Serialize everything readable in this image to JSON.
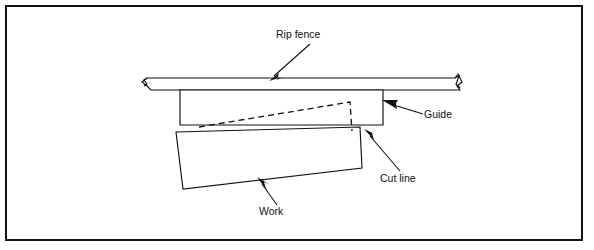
{
  "figure": {
    "type": "line-diagram",
    "background_color": "#ffffff",
    "ink_color": "#111111",
    "frame": {
      "name": "outer-border",
      "x": 6,
      "y": 6,
      "width": 576,
      "height": 234,
      "stroke_width": 2
    },
    "labels": [
      {
        "id": "rip-fence",
        "text": "Rip fence",
        "x": 276,
        "y": 38,
        "anchor": "start",
        "leader": {
          "x1": 310,
          "y1": 44,
          "x2": 271,
          "y2": 79
        }
      },
      {
        "id": "guide",
        "text": "Guide",
        "x": 424,
        "y": 118,
        "anchor": "start",
        "leader": {
          "x1": 420,
          "y1": 114,
          "x2": 382,
          "y2": 104
        }
      },
      {
        "id": "cut-line",
        "text": "Cut line",
        "x": 380,
        "y": 182,
        "anchor": "start",
        "leader": {
          "x1": 399,
          "y1": 172,
          "x2": 364,
          "y2": 131
        }
      },
      {
        "id": "work",
        "text": "Work",
        "x": 259,
        "y": 215,
        "anchor": "start",
        "leader": {
          "x1": 276,
          "y1": 204,
          "x2": 257,
          "y2": 180
        }
      }
    ],
    "parts": {
      "rip_fence": {
        "name": "Rip fence",
        "description": "Long horizontal bar with break symbols at both ends",
        "top_y": 78,
        "bottom_y": 89,
        "left_x": 140,
        "right_x": 460
      },
      "guide": {
        "name": "Guide",
        "description": "Rectangular block below the fence",
        "left_x": 180,
        "right_x": 383,
        "top_y": 89,
        "bottom_y": 125
      },
      "work": {
        "name": "Work",
        "description": "Tilted rectangular workpiece",
        "corners": [
          [
            176,
            132
          ],
          [
            360,
            127
          ],
          [
            362,
            168
          ],
          [
            183,
            189
          ]
        ]
      },
      "cut_line": {
        "name": "Cut line",
        "description": "Dashed angled line ending in a short vertical drop",
        "points": [
          [
            199,
            127
          ],
          [
            350,
            102
          ],
          [
            352,
            130
          ]
        ]
      }
    }
  }
}
